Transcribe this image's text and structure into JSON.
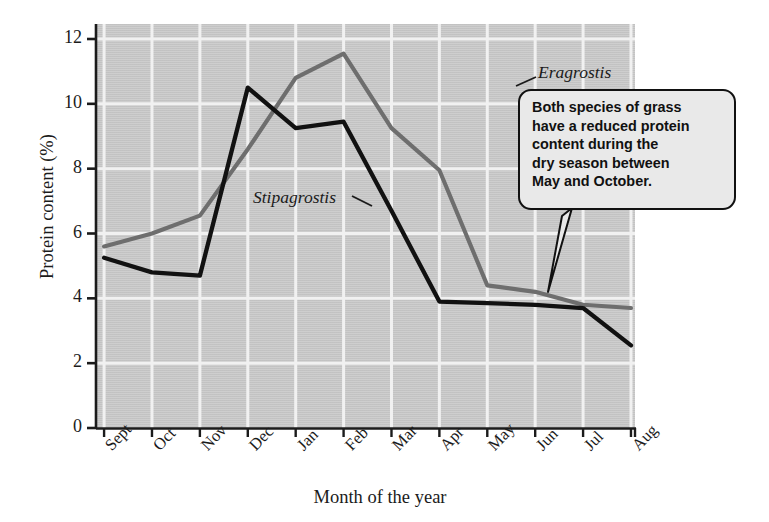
{
  "chart_data": {
    "type": "line",
    "title": "",
    "xlabel": "Month of the year",
    "ylabel": "Protein content (%)",
    "categories": [
      "Sept",
      "Oct",
      "Nov",
      "Dec",
      "Jan",
      "Feb",
      "Mar",
      "Apr",
      "May",
      "Jun",
      "Jul",
      "Aug"
    ],
    "ylim": [
      0,
      12.4
    ],
    "yticks": [
      "0",
      "2",
      "4",
      "6",
      "8",
      "10",
      "12"
    ],
    "grid": true,
    "legend_position": "in-plot labels",
    "plot_background": "#c9c9c9",
    "series": [
      {
        "name": "Eragrostis",
        "color": "#6e6e6e",
        "values": [
          5.6,
          6.0,
          6.55,
          8.6,
          10.8,
          11.55,
          9.25,
          7.95,
          4.4,
          4.2,
          3.8,
          3.7
        ]
      },
      {
        "name": "Stipagrostis",
        "color": "#111111",
        "values": [
          5.25,
          4.8,
          4.7,
          10.5,
          9.25,
          9.45,
          6.7,
          3.9,
          3.85,
          3.8,
          3.7,
          2.55
        ]
      }
    ],
    "annotations": [
      {
        "name": "dry-season-callout",
        "lines": [
          "Both species of grass",
          "have a reduced protein",
          "content during the",
          "dry season between",
          "May and October."
        ],
        "text": "Both species of grass have a reduced protein content during the dry season between May and October.",
        "pointer_target_month": "Jun"
      }
    ]
  },
  "series_labels": {
    "eragrostis": "Eragrostis",
    "stipagrostis": "Stipagrostis"
  }
}
